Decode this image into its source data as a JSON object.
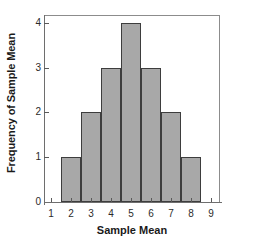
{
  "chart_data": {
    "type": "bar",
    "title": "",
    "subtitle": "",
    "xlabel": "Sample Mean",
    "ylabel": "Frequency of Sample Mean",
    "categories": [
      "2",
      "3",
      "4",
      "5",
      "6",
      "7",
      "8"
    ],
    "values": [
      1,
      2,
      3,
      4,
      3,
      2,
      1
    ],
    "bin_edges": [
      1.5,
      2.5,
      3.5,
      4.5,
      5.5,
      6.5,
      7.5,
      8.5
    ],
    "bin_centers": [
      2,
      3,
      4,
      5,
      6,
      7,
      8
    ],
    "xlim": [
      0.7,
      9.4
    ],
    "ylim": [
      0,
      4.15
    ],
    "x_ticks": [
      "1",
      "2",
      "3",
      "4",
      "5",
      "6",
      "7",
      "8",
      "9"
    ],
    "x_tick_values": [
      1,
      2,
      3,
      4,
      5,
      6,
      7,
      8,
      9
    ],
    "y_ticks": [
      "0",
      "1",
      "2",
      "3",
      "4"
    ],
    "y_tick_values": [
      0,
      1,
      2,
      3,
      4
    ],
    "grid": false,
    "legend": null,
    "legend_position": "none",
    "annotations": [],
    "bar_fill_color": "#a8a8a8",
    "bar_edge_color": "#3d3d3d",
    "axis_color": "#6e6e6e",
    "text_color": "#1a1a1a",
    "background_color": "#ffffff"
  }
}
